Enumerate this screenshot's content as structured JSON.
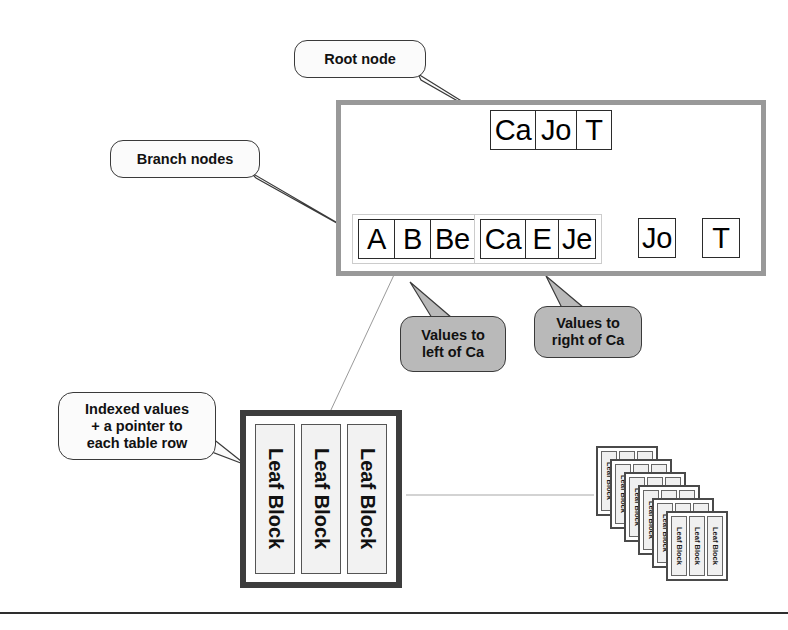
{
  "diagram": {
    "root_node": {
      "label": "Root node",
      "cells": [
        "Ca",
        "Jo",
        "T"
      ]
    },
    "branch_nodes": {
      "label": "Branch nodes",
      "groups": [
        {
          "name": "left-of-ca",
          "cells": [
            "A",
            "B",
            "Be"
          ]
        },
        {
          "name": "right-of-ca",
          "cells": [
            "Ca",
            "E",
            "Je"
          ]
        }
      ],
      "singles": [
        {
          "name": "jo",
          "cell": "Jo"
        },
        {
          "name": "t",
          "cell": "T"
        }
      ]
    },
    "annotations": {
      "left_of_ca": {
        "line1": "Values to",
        "line2": "left of Ca"
      },
      "right_of_ca": {
        "line1": "Values to",
        "line2": "right of Ca"
      },
      "indexed_values": {
        "line1": "Indexed values",
        "line2": "+ a pointer to",
        "line3": "each table row"
      }
    },
    "leaf_blocks": {
      "label": "Leaf Block",
      "count": 3
    },
    "leaf_stack": {
      "label": "Leaf Block",
      "stack_count": 6,
      "blocks_per_group": 3
    },
    "colors": {
      "tree_border": "#999999",
      "callout_gray": "#b9b9b9",
      "callout_light": "#fbfbfb",
      "leaf_border": "#3d3d3d",
      "connector": "#8a8a8a",
      "text": "#111111",
      "rule": "#2e2e2e"
    }
  }
}
